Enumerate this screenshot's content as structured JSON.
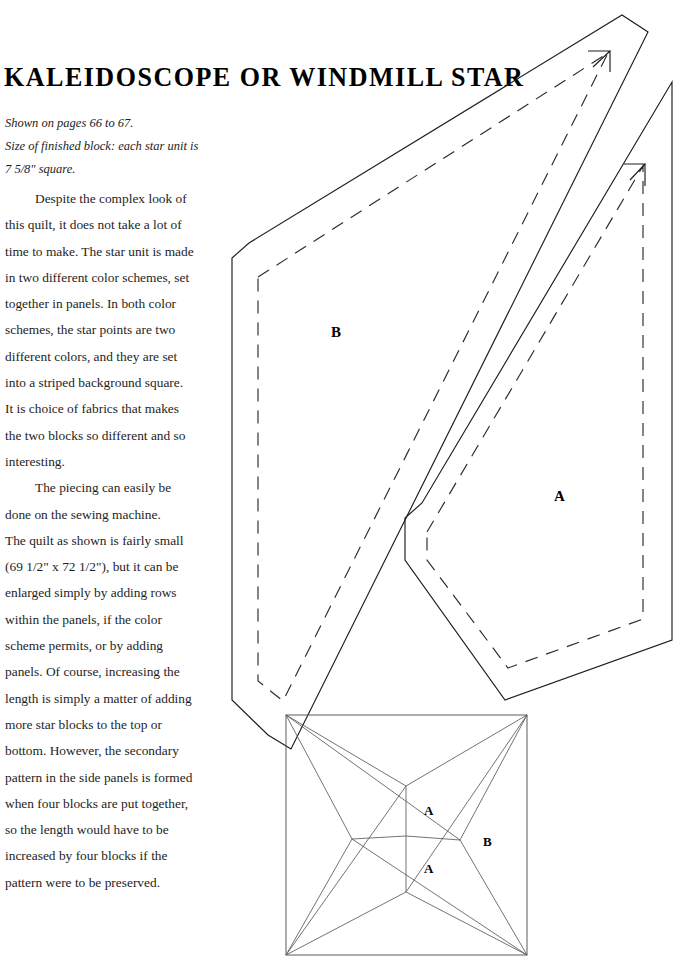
{
  "page": {
    "width": 695,
    "height": 974,
    "background_color": "#ffffff",
    "ink_color": "#1a1a1a"
  },
  "title": "KALEIDOSCOPE OR WINDMILL STAR",
  "subhead": {
    "lines": [
      "Shown on pages 66 to 67.",
      "Size of finished block: each star unit is",
      "7 5/8\" square."
    ]
  },
  "body": {
    "paragraphs": [
      {
        "indent_first_line": true,
        "lines": [
          "Despite the complex look of",
          "this quilt, it does not take a lot of",
          "time to make. The star unit is made",
          "in two different color schemes, set",
          "together in panels. In both color",
          "schemes, the star points are two",
          "different colors, and they are set",
          "into a striped background square.",
          "It is choice of fabrics that makes",
          "the two blocks so different and so",
          "interesting."
        ]
      },
      {
        "indent_first_line": true,
        "lines": [
          "The piecing can easily be",
          "done on the sewing machine.",
          "The quilt as shown is fairly small",
          "(69 1/2\" x 72 1/2\"), but it can be",
          "enlarged simply by adding rows",
          "within the panels, if the color",
          "scheme permits, or by adding",
          "panels. Of course, increasing the",
          "length is simply a matter of adding",
          "more star blocks to the top or",
          "bottom. However, the secondary",
          "pattern in the side panels is formed",
          "when four blocks are put together,",
          "so the length would have to be",
          "increased by four blocks if the",
          "pattern were to be preserved."
        ]
      }
    ]
  },
  "templates": {
    "line_styles": {
      "cutting_line": "solid",
      "seam_line": "dashed",
      "cut_color": "#1d1d1d",
      "seam_color": "#2a2a2a"
    },
    "pieces": [
      {
        "id": "piece-b",
        "label": "B",
        "label_position": {
          "x": 331,
          "y": 325
        },
        "cut_outline": "M 232,258 L 249,243 L 622,15 L 648,32 L 291,749 L 268,735 L 232,700 Z",
        "seam_outline": "M 258,277 L 608,53 L 283,701 L 258,681 Z",
        "grain_arrow": "M 593,67 L 610,51 L 588,51 M 610,51 L 610,72"
      },
      {
        "id": "piece-a",
        "label": "A",
        "label_position": {
          "x": 554,
          "y": 489
        },
        "cut_outline": "M 405,518 L 422,503 L 672,82 L 672,640 L 505,700 L 405,560 Z",
        "seam_outline": "M 427,532 L 643,166 L 643,619 L 508,668 L 427,560 Z",
        "grain_arrow": "M 630,180 L 645,164 L 624,164 M 645,164 L 645,186"
      }
    ]
  },
  "block_diagram": {
    "name": "star-unit-block",
    "square": {
      "x": 286,
      "y": 715,
      "width": 241,
      "height": 240
    },
    "center": {
      "x": 406,
      "y": 836
    },
    "star_points": {
      "top": {
        "x": 406,
        "y": 786
      },
      "right": {
        "x": 460,
        "y": 840
      },
      "bottom": {
        "x": 406,
        "y": 892
      },
      "left": {
        "x": 352,
        "y": 839
      }
    },
    "labels": [
      {
        "text": "A",
        "x": 424,
        "y": 804
      },
      {
        "text": "B",
        "x": 483,
        "y": 835
      },
      {
        "text": "A",
        "x": 424,
        "y": 862
      }
    ]
  }
}
